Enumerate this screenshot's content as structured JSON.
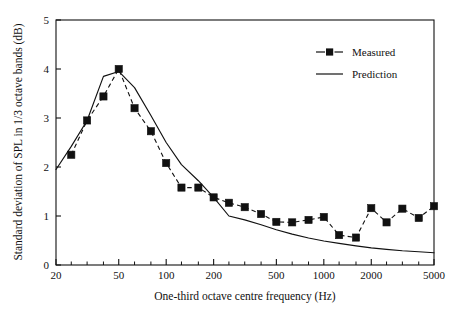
{
  "chart_data": {
    "type": "line",
    "title": "",
    "xlabel": "One-third octave centre frequency (Hz)",
    "ylabel": "Standard deviation of SPL in 1/3 octave bands (dB)",
    "xscale": "log",
    "xlim": [
      20,
      5000
    ],
    "ylim": [
      0,
      5
    ],
    "yticks": [
      0,
      1,
      2,
      3,
      4,
      5
    ],
    "ytick_labels": [
      "0",
      "1",
      "2",
      "3",
      "4",
      "5"
    ],
    "xticks": [
      20,
      50,
      100,
      200,
      500,
      1000,
      2000,
      5000
    ],
    "xtick_labels": [
      "20",
      "50",
      "100",
      "200",
      "500",
      "1000",
      "2000",
      "5000"
    ],
    "xminor_ticks": [
      25,
      31.5,
      40,
      63,
      80,
      125,
      160,
      250,
      315,
      400,
      630,
      800,
      1250,
      1600,
      2500,
      3150,
      4000
    ],
    "grid": false,
    "legend_position": "top-right",
    "series": [
      {
        "name": "Measured",
        "style": "dashed",
        "marker": "square",
        "color": "#111111",
        "x": [
          25,
          31.5,
          40,
          50,
          63,
          80,
          100,
          125,
          160,
          200,
          250,
          315,
          400,
          500,
          630,
          800,
          1000,
          1250,
          1600,
          2000,
          2500,
          3150,
          4000,
          5000
        ],
        "values": [
          2.25,
          2.95,
          3.44,
          4.0,
          3.2,
          2.73,
          2.08,
          1.58,
          1.58,
          1.38,
          1.27,
          1.18,
          1.04,
          0.88,
          0.87,
          0.92,
          0.98,
          0.61,
          0.56,
          1.16,
          0.87,
          1.15,
          0.96,
          1.2
        ]
      },
      {
        "name": "Prediction",
        "style": "solid",
        "marker": "none",
        "color": "#111111",
        "x": [
          20,
          25,
          31.5,
          40,
          50,
          63,
          80,
          100,
          125,
          160,
          200,
          250,
          315,
          400,
          500,
          630,
          800,
          1000,
          1250,
          1600,
          2000,
          2500,
          3150,
          4000,
          5000
        ],
        "values": [
          1.95,
          2.42,
          2.95,
          3.85,
          3.95,
          3.62,
          3.05,
          2.5,
          2.05,
          1.72,
          1.38,
          1.0,
          0.92,
          0.82,
          0.72,
          0.63,
          0.55,
          0.49,
          0.44,
          0.39,
          0.35,
          0.32,
          0.29,
          0.27,
          0.25
        ]
      }
    ],
    "legend": [
      {
        "label": "Measured",
        "style": "dashed",
        "marker": "square"
      },
      {
        "label": "Prediction",
        "style": "solid",
        "marker": "none"
      }
    ]
  },
  "axes": {
    "y_title": "Standard deviation of SPL in 1/3 octave bands (dB)",
    "x_title": "One-third octave centre frequency (Hz)",
    "y_labels": [
      "5",
      "4",
      "3",
      "2",
      "1",
      "0"
    ],
    "x_labels": [
      "20",
      "50",
      "100",
      "200",
      "500",
      "1000",
      "2000",
      "5000"
    ]
  },
  "legend": {
    "measured_label": "Measured",
    "prediction_label": "Prediction"
  },
  "colors": {
    "ink": "#111111",
    "background": "#ffffff"
  }
}
